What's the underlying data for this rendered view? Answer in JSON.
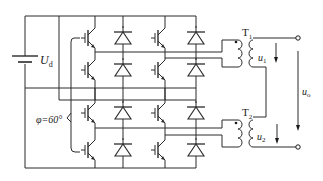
{
  "diagram": {
    "type": "circuit",
    "labels": {
      "dc_source": "U",
      "dc_source_sub": "d",
      "phase_shift": "φ=60°",
      "transformer_1": "T",
      "transformer_1_sub": "1",
      "transformer_2": "T",
      "transformer_2_sub": "2",
      "voltage_1": "u",
      "voltage_1_sub": "1",
      "voltage_2": "u",
      "voltage_2_sub": "2",
      "output_voltage": "u",
      "output_voltage_sub": "o"
    },
    "components": {
      "igbts": 8,
      "diodes": 8,
      "transformers": 2,
      "dc_sources": 1,
      "output_terminals": 2
    },
    "colors": {
      "line": "#2a2a2a",
      "background": "#ffffff"
    }
  }
}
